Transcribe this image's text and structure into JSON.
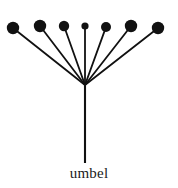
{
  "figure": {
    "caption": "umbel",
    "type": "inflorescence-diagram",
    "background_color": "#ffffff",
    "ink_color": "#111111",
    "width": 178,
    "height": 188
  },
  "diagram": {
    "apex": {
      "x": 85,
      "y": 85
    },
    "peduncle": {
      "label": "main stem",
      "x1": 85,
      "y1": 85,
      "x2": 85,
      "y2": 163,
      "stroke_width": 2.1
    },
    "pedicel_stroke_width": 1.8,
    "flower_count": 7,
    "flowers": [
      {
        "index": 1,
        "cx": 13,
        "cy": 28,
        "r": 6.2
      },
      {
        "index": 2,
        "cx": 40,
        "cy": 26,
        "r": 6.2
      },
      {
        "index": 3,
        "cx": 64,
        "cy": 26,
        "r": 5.2
      },
      {
        "index": 4,
        "cx": 85,
        "cy": 26,
        "r": 3.6
      },
      {
        "index": 5,
        "cx": 106,
        "cy": 27,
        "r": 5.0
      },
      {
        "index": 6,
        "cx": 131,
        "cy": 26,
        "r": 6.2
      },
      {
        "index": 7,
        "cx": 158,
        "cy": 28,
        "r": 6.2
      }
    ]
  },
  "chart_data": {
    "type": "diagram",
    "title": "umbel",
    "nodes": 7,
    "node_positions_x": [
      13,
      40,
      64,
      85,
      106,
      131,
      158
    ],
    "node_positions_y": [
      28,
      26,
      26,
      26,
      27,
      26,
      28
    ],
    "node_radii": [
      6.2,
      6.2,
      5.2,
      3.6,
      5.0,
      6.2,
      6.2
    ],
    "origin": [
      85,
      85
    ],
    "stem_base": [
      85,
      163
    ]
  }
}
